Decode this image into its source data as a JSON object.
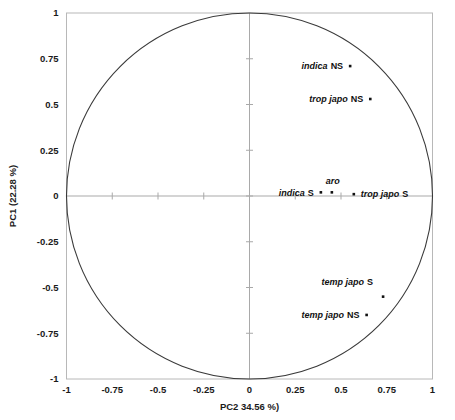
{
  "chart_data": {
    "type": "scatter",
    "title": "",
    "subtitle": "",
    "xlabel": "PC2 34.56 %)",
    "ylabel": "PC1 (22.28 %)",
    "xlim": [
      -1,
      1
    ],
    "ylim": [
      -1,
      1
    ],
    "grid": false,
    "legend": "none",
    "annotation": "PCA correlation circle: unit circle drawn from -1 to 1 on both axes",
    "xticks": [
      "-1",
      "-0.75",
      "-0.5",
      "-0.25",
      "0",
      "0.25",
      "0.5",
      "0.75",
      "1"
    ],
    "xtick_values": [
      -1,
      -0.75,
      -0.5,
      -0.25,
      0,
      0.25,
      0.5,
      0.75,
      1
    ],
    "yticks": [
      "-1",
      "-0.75",
      "-0.5",
      "-0.25",
      "0",
      "0.25",
      "0.5",
      "0.75",
      "1"
    ],
    "ytick_values": [
      -1,
      -0.75,
      -0.5,
      -0.25,
      0,
      0.25,
      0.5,
      0.75,
      1
    ],
    "reference_circle": {
      "center": [
        0,
        0
      ],
      "radius": 1
    },
    "points": [
      {
        "label": "indica NS",
        "species": "indica",
        "suffix": "NS",
        "x": 0.55,
        "y": 0.71,
        "label_pos": "left"
      },
      {
        "label": "trop japo NS",
        "species": "trop japo",
        "suffix": "NS",
        "x": 0.66,
        "y": 0.53,
        "label_pos": "left"
      },
      {
        "label": "indica S",
        "species": "indica",
        "suffix": "S",
        "x": 0.39,
        "y": 0.02,
        "label_pos": "left"
      },
      {
        "label": "aro",
        "species": "aro",
        "suffix": "",
        "x": 0.45,
        "y": 0.02,
        "label_pos": "above"
      },
      {
        "label": "trop japo S",
        "species": "trop japo",
        "suffix": "S",
        "x": 0.57,
        "y": 0.01,
        "label_pos": "right"
      },
      {
        "label": "temp japo S",
        "species": "temp japo",
        "suffix": "S",
        "x": 0.73,
        "y": -0.55,
        "label_pos": "left-above"
      },
      {
        "label": "temp japo NS",
        "species": "temp japo",
        "suffix": "NS",
        "x": 0.64,
        "y": -0.65,
        "label_pos": "left"
      }
    ]
  }
}
